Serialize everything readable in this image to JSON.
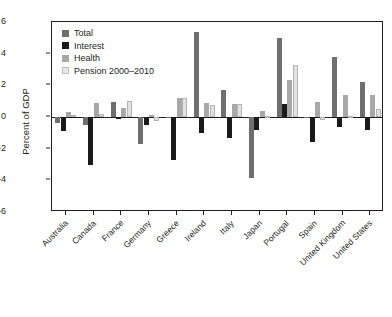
{
  "chart_data": {
    "type": "bar",
    "title": "",
    "xlabel": "",
    "ylabel": "Percent of GDP",
    "ylim": [
      -6,
      6
    ],
    "yticks": [
      6,
      4,
      2,
      0,
      -2,
      -4,
      -6
    ],
    "ytick_labels": [
      "6",
      "4",
      "2",
      "0",
      "-2",
      "-4",
      "-6"
    ],
    "grid": false,
    "legend_position": "top-left",
    "categories": [
      "Australia",
      "Canada",
      "France",
      "Germany",
      "Greece",
      "Ireland",
      "Italy",
      "Japan",
      "Portugal",
      "Spain",
      "United Kingdom",
      "United States"
    ],
    "series": [
      {
        "name": "Total",
        "color": "#6f6f6f",
        "values": [
          -0.4,
          -0.5,
          0.95,
          -1.7,
          -0.05,
          5.4,
          1.7,
          -3.85,
          5.0,
          0.0,
          3.8,
          2.2
        ]
      },
      {
        "name": "Interest",
        "color": "#1a1a1a",
        "values": [
          -0.9,
          -3.0,
          -0.15,
          -0.5,
          -2.7,
          -1.0,
          -1.35,
          -0.8,
          0.8,
          -1.6,
          -0.6,
          -0.8
        ]
      },
      {
        "name": "Health",
        "color": "#a8a8a8",
        "values": [
          0.3,
          0.9,
          0.6,
          0.15,
          1.2,
          0.9,
          0.85,
          0.4,
          2.35,
          0.95,
          1.4,
          1.4
        ]
      },
      {
        "name": "Pension 2000–2010",
        "color": "#e2e2e2",
        "values": [
          0.1,
          0.2,
          1.0,
          -0.25,
          1.2,
          0.75,
          0.8,
          0.05,
          3.3,
          -0.2,
          0.05,
          0.5
        ]
      }
    ]
  },
  "legend": {
    "items": [
      {
        "label": "Total"
      },
      {
        "label": "Interest"
      },
      {
        "label": "Health"
      },
      {
        "label": "Pension 2000–2010"
      }
    ]
  }
}
